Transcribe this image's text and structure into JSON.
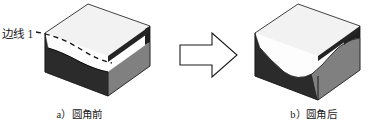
{
  "figure": {
    "background_color": "#ffffff",
    "annotation": {
      "edge_label": "边线 1"
    },
    "panels": [
      {
        "id": "before",
        "caption": "a）圆角前",
        "solid_name": "sharp-edge-block",
        "faces": {
          "top_color": "#f2f2f2",
          "left_color": "#2b2b2b",
          "right_color": "#808080",
          "inner_color": "#ffffff",
          "outline_color": "#151515"
        }
      },
      {
        "id": "after",
        "caption": "b）圆角后",
        "solid_name": "filleted-edge-block",
        "faces": {
          "top_color": "#f2f2f2",
          "left_color": "#2b2b2b",
          "right_color": "#808080",
          "inner_color": "#ffffff",
          "outline_color": "#151515"
        }
      }
    ],
    "arrow": {
      "name": "transformation-arrow",
      "direction": "right",
      "fill_color": "#ffffff",
      "stroke_color": "#1a1a1a"
    }
  }
}
